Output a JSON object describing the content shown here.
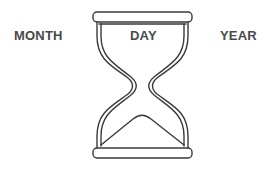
{
  "labels": {
    "left": "MONTH",
    "center": "DAY",
    "right": "YEAR"
  },
  "icon": "hourglass-icon",
  "colors": {
    "stroke": "#3a3a3a",
    "text": "#4a4a4a",
    "background": "#ffffff"
  }
}
